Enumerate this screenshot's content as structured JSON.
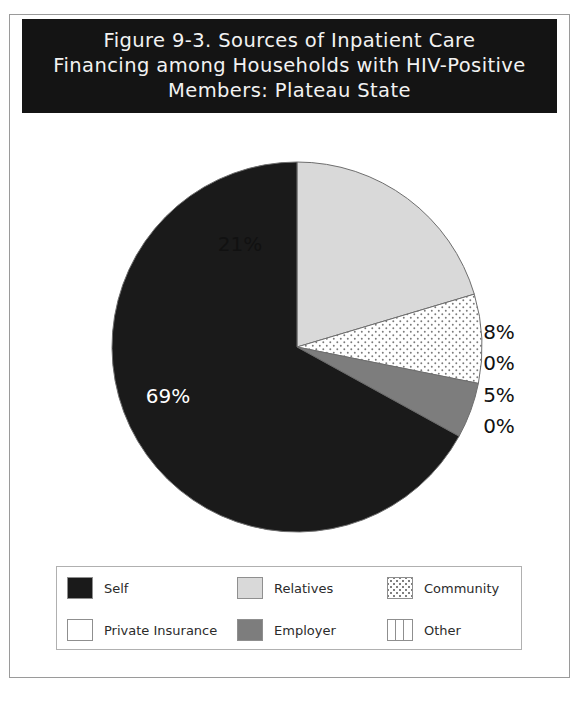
{
  "figure": {
    "title_lines": [
      "Figure 9-3. Sources of Inpatient Care",
      "Financing among Households with HIV-Positive",
      "Members: Plateau State"
    ],
    "title_background": "#141414",
    "title_color": "#f2f2f2",
    "frame_border_color": "#9a9a9a"
  },
  "chart_data": {
    "type": "pie",
    "title": "Figure 9-3. Sources of Inpatient Care Financing among Households with HIV-Positive Members: Plateau State",
    "xlabel": "",
    "ylabel": "",
    "legend_position": "bottom",
    "grid": false,
    "start_angle_deg": 0,
    "direction": "clockwise",
    "categories": [
      "Relatives",
      "Community",
      "Private Insurance",
      "Employer",
      "Other",
      "Self"
    ],
    "values": [
      21,
      8,
      0,
      5,
      0,
      69
    ],
    "labels": [
      "21%",
      "8%",
      "0%",
      "5%",
      "0%",
      "69%"
    ],
    "colors": [
      "#d9d9d9",
      "#ffffff",
      "#ffffff",
      "#7d7d7d",
      "#ffffff",
      "#1a1a1a"
    ],
    "patterns": [
      "solid",
      "dots",
      "solid",
      "solid",
      "vertical-lines",
      "solid"
    ],
    "series": [
      {
        "name": "Sources of inpatient care financing",
        "points": [
          {
            "category": "Relatives",
            "value": 21,
            "label": "21%",
            "color": "#d9d9d9",
            "pattern": "solid",
            "label_placement": "inside"
          },
          {
            "category": "Community",
            "value": 8,
            "label": "8%",
            "color": "#ffffff",
            "pattern": "dots",
            "label_placement": "outside"
          },
          {
            "category": "Private Insurance",
            "value": 0,
            "label": "0%",
            "color": "#ffffff",
            "pattern": "solid",
            "label_placement": "outside"
          },
          {
            "category": "Employer",
            "value": 5,
            "label": "5%",
            "color": "#7d7d7d",
            "pattern": "solid",
            "label_placement": "outside"
          },
          {
            "category": "Other",
            "value": 0,
            "label": "0%",
            "color": "#ffffff",
            "pattern": "vertical-lines",
            "label_placement": "outside"
          },
          {
            "category": "Self",
            "value": 69,
            "label": "69%",
            "color": "#1a1a1a",
            "pattern": "solid",
            "label_placement": "inside"
          }
        ]
      }
    ],
    "inside_labels": [
      {
        "text": "21%",
        "color": "#111111"
      },
      {
        "text": "69%",
        "color": "#ffffff"
      }
    ],
    "outside_labels": [
      "8%",
      "0%",
      "5%",
      "0%"
    ]
  },
  "legend": {
    "items": [
      {
        "label": "Self",
        "swatch": "sw-self",
        "swatch_name": "legend-swatch-self"
      },
      {
        "label": "Relatives",
        "swatch": "sw-relatives",
        "swatch_name": "legend-swatch-relatives"
      },
      {
        "label": "Community",
        "swatch": "sw-community",
        "swatch_name": "legend-swatch-community"
      },
      {
        "label": "Private Insurance",
        "swatch": "sw-private",
        "swatch_name": "legend-swatch-private-insurance"
      },
      {
        "label": "Employer",
        "swatch": "sw-employer",
        "swatch_name": "legend-swatch-employer"
      },
      {
        "label": "Other",
        "swatch": "sw-other",
        "swatch_name": "legend-swatch-other"
      }
    ]
  }
}
